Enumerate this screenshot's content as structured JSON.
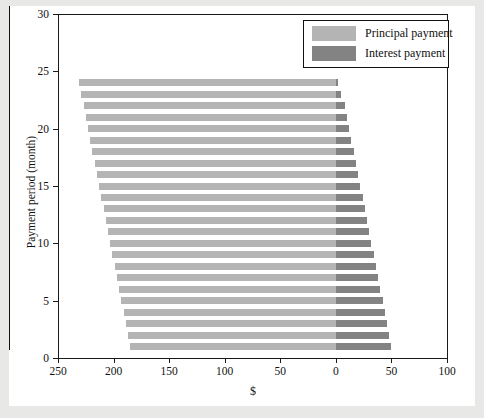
{
  "chart_data": {
    "type": "bar",
    "title": "",
    "subtitle": "",
    "xlabel": "$",
    "ylabel": "Payment period (month)",
    "orientation": "horizontal",
    "style": "butterfly",
    "grid": false,
    "legend_position": "top-right",
    "xlim": [
      250,
      -100
    ],
    "ylim": [
      0,
      30
    ],
    "x_ticks": [
      250,
      200,
      150,
      100,
      50,
      0,
      50,
      100
    ],
    "x_tick_values": [
      250,
      200,
      150,
      100,
      50,
      0,
      -50,
      -100
    ],
    "y_ticks": [
      0,
      5,
      10,
      15,
      20,
      25,
      30
    ],
    "categories": [
      1,
      2,
      3,
      4,
      5,
      6,
      7,
      8,
      9,
      10,
      11,
      12,
      13,
      14,
      15,
      16,
      17,
      18,
      19,
      20,
      21,
      22,
      23,
      24
    ],
    "series": [
      {
        "name": "Principal payment",
        "color": "#b4b4b4",
        "direction": "left",
        "values": [
          185,
          187,
          189,
          191,
          193,
          195,
          197,
          199,
          201,
          203,
          205,
          207,
          209,
          211,
          213,
          215,
          217,
          219,
          221,
          223,
          225,
          227,
          229,
          231
        ]
      },
      {
        "name": "Interest payment",
        "color": "#838383",
        "direction": "right",
        "values": [
          50,
          48,
          46,
          44,
          42,
          40,
          38,
          36,
          34,
          32,
          30,
          28,
          26,
          24,
          22,
          20,
          18,
          16,
          14,
          12,
          10,
          8,
          5,
          2
        ]
      }
    ],
    "legend": [
      {
        "label": "Principal payment",
        "color": "#b4b4b4"
      },
      {
        "label": "Interest payment",
        "color": "#838383"
      }
    ]
  }
}
